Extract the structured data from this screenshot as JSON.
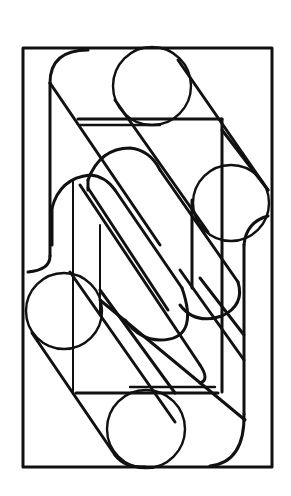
{
  "figure": {
    "title": "",
    "stroke_color": "#111111",
    "background": "#ffffff",
    "shapes": {
      "outer_rect": {
        "x": 23,
        "y": 48,
        "w": 249,
        "h": 419
      },
      "inner_rect": {
        "x": 75,
        "y": 118,
        "w": 149,
        "h": 274
      },
      "circles": [
        {
          "name": "top",
          "cx": 152,
          "cy": 86,
          "r": 39
        },
        {
          "name": "right",
          "cx": 231,
          "cy": 203,
          "r": 39
        },
        {
          "name": "left",
          "cx": 64,
          "cy": 311,
          "r": 38
        },
        {
          "name": "bottom",
          "cx": 146,
          "cy": 429,
          "r": 39
        }
      ]
    }
  }
}
